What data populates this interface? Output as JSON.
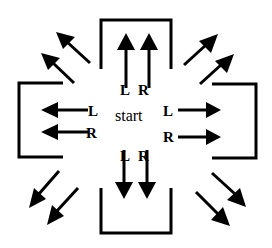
{
  "diagram": {
    "center_label": "start",
    "labels": {
      "up_left": "L",
      "up_right": "R",
      "down_left": "L",
      "down_right": "R",
      "left_top": "L",
      "left_bottom": "R",
      "right_top": "L",
      "right_bottom": "R"
    },
    "colors": {
      "stroke": "#000000",
      "background": "#ffffff"
    }
  }
}
